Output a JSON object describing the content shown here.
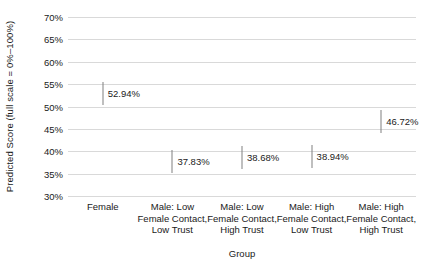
{
  "chart_data": {
    "type": "scatter",
    "title": "",
    "xlabel": "Group",
    "ylabel": "Predicted Score (full scale = 0%–100%)",
    "ylim": [
      30,
      70
    ],
    "ytick_labels": [
      "70%",
      "65%",
      "60%",
      "55%",
      "50%",
      "45%",
      "40%",
      "35%",
      "30%"
    ],
    "ytick_values": [
      70,
      65,
      60,
      55,
      50,
      45,
      40,
      35,
      30
    ],
    "grid": true,
    "legend": "none",
    "categories": [
      "Female",
      "Male: Low Female Contact, Low Trust",
      "Male: Low Female Contact, High Trust",
      "Male: High Female Contact, Low Trust",
      "Male: High Female Contact, High Trust"
    ],
    "category_label_lines": [
      [
        "Female"
      ],
      [
        "Male: Low",
        "Female Contact,",
        "Low Trust"
      ],
      [
        "Male: Low",
        "Female Contact,",
        "High Trust"
      ],
      [
        "Male: High",
        "Female Contact,",
        "Low Trust"
      ],
      [
        "Male: High",
        "Female Contact,",
        "High Trust"
      ]
    ],
    "values": [
      52.94,
      37.83,
      38.68,
      38.94,
      46.72
    ],
    "data_labels": [
      "52.94%",
      "37.83%",
      "38.68%",
      "38.94%",
      "46.72%"
    ],
    "marker_style": "vertical-tick",
    "marker_color": "#808080",
    "gridline_color": "#d9d9d9",
    "background_color": "#ffffff",
    "text_color": "#1a1a1a"
  },
  "axes": {
    "y_title": "Predicted Score (full scale = 0%–100%)",
    "x_title": "Group"
  }
}
